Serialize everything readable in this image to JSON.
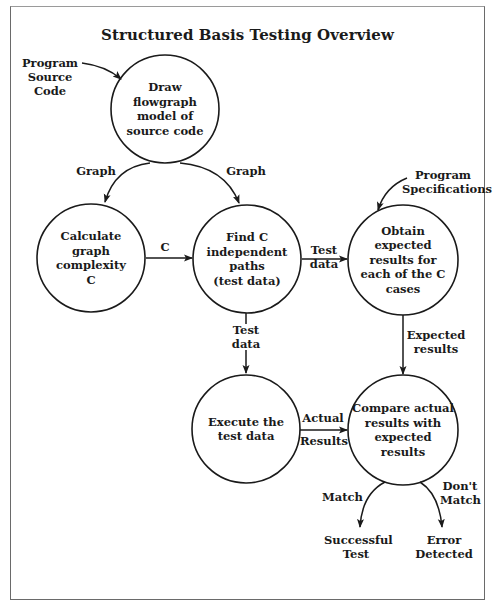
{
  "title": "Structured Basis Testing Overview",
  "colors": {
    "line": "#1a1a1a",
    "frame": "#6a6a6a",
    "background": "#ffffff"
  },
  "nodes": {
    "draw_flowgraph": {
      "lines": [
        "Draw",
        "flowgraph",
        "model of",
        "source code"
      ],
      "cx": 165,
      "cy": 109,
      "r": 54
    },
    "calculate_complexity": {
      "lines": [
        "Calculate",
        "graph",
        "complexity",
        "C"
      ],
      "cx": 91,
      "cy": 258,
      "r": 54
    },
    "find_paths": {
      "lines": [
        "Find C",
        "independent",
        "paths",
        "(test data)"
      ],
      "cx": 247,
      "cy": 259,
      "r": 54
    },
    "obtain_expected": {
      "lines": [
        "Obtain",
        "expected",
        "results for",
        "each of the C",
        "cases"
      ],
      "cx": 403,
      "cy": 260,
      "r": 55
    },
    "execute_tests": {
      "lines": [
        "Execute the",
        "test data"
      ],
      "cx": 246,
      "cy": 429,
      "r": 54
    },
    "compare_results": {
      "lines": [
        "Compare actual",
        "results with",
        "expected",
        "results"
      ],
      "cx": 403,
      "cy": 430,
      "r": 55
    }
  },
  "inputs": {
    "program_source_code": [
      "Program",
      "Source",
      "Code"
    ],
    "program_specifications": [
      "Program",
      "Specifications"
    ]
  },
  "edges": {
    "graph_left": "Graph",
    "graph_right": "Graph",
    "c": "C",
    "test_data_right": [
      "Test",
      "data"
    ],
    "test_data_down": [
      "Test",
      "data"
    ],
    "expected_results": [
      "Expected",
      "results"
    ],
    "actual_results": [
      "Actual",
      "Results"
    ],
    "match": "Match",
    "dont_match": [
      "Don't",
      "Match"
    ]
  },
  "outcomes": {
    "successful_test": [
      "Successful",
      "Test"
    ],
    "error_detected": [
      "Error",
      "Detected"
    ]
  }
}
